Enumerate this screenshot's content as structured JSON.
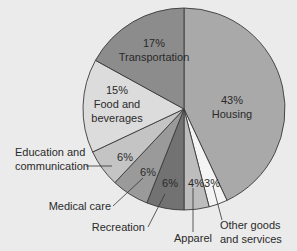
{
  "chart_data": {
    "type": "pie",
    "title": "",
    "start_angle": "12 o'clock",
    "direction": "clockwise",
    "slices": [
      {
        "label": "Housing",
        "value": 43,
        "display": "43%",
        "color": "#a9a9a9"
      },
      {
        "label": "Other goods and services",
        "value": 3,
        "display": "3%",
        "color": "#f4f4f4"
      },
      {
        "label": "Apparel",
        "value": 4,
        "display": "4%",
        "color": "#bdbdbd"
      },
      {
        "label": "Recreation",
        "value": 6,
        "display": "6%",
        "color": "#727272"
      },
      {
        "label": "Medical care",
        "value": 6,
        "display": "6%",
        "color": "#9a9a9a"
      },
      {
        "label": "Education and communication",
        "value": 6,
        "display": "6%",
        "color": "#c4c4c4"
      },
      {
        "label": "Food and beverages",
        "value": 15,
        "display": "15%",
        "color": "#dcdcdc"
      },
      {
        "label": "Transportation",
        "value": 17,
        "display": "17%",
        "color": "#8c8c8c"
      }
    ],
    "legend": "none (callout labels)"
  },
  "labels": {
    "housing_pct": "43%",
    "housing": "Housing",
    "transport_pct": "17%",
    "transport": "Transportation",
    "food_pct": "15%",
    "food_1": "Food and",
    "food_2": "beverages",
    "edu_pct": "6%",
    "edu_1": "Education and",
    "edu_2": "communication",
    "med_pct": "6%",
    "med": "Medical care",
    "rec_pct": "6%",
    "rec": "Recreation",
    "app_pct": "4%",
    "app": "Apparel",
    "other_pct": "3%",
    "other_1": "Other goods",
    "other_2": "and services"
  }
}
